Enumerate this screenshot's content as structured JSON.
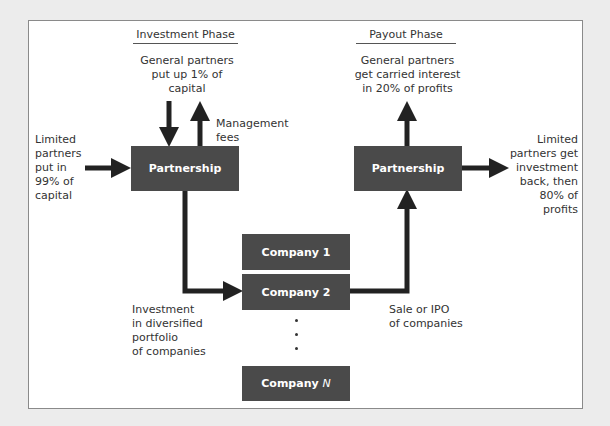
{
  "phases": {
    "investment": "Investment Phase",
    "payout": "Payout Phase"
  },
  "labels": {
    "gp_put_up": [
      "General partners",
      "put up 1% of",
      "capital"
    ],
    "management_fees": [
      "Management",
      "fees"
    ],
    "lp_put_in": [
      "Limited",
      "partners",
      "put in",
      "99% of",
      "capital"
    ],
    "gp_carried": [
      "General partners",
      "get carried interest",
      "in 20% of profits"
    ],
    "lp_get_back": [
      "Limited",
      "partners get",
      "investment",
      "back, then",
      "80% of",
      "profits"
    ],
    "investment_portfolio": [
      "Investment",
      "in diversified",
      "portfolio",
      "of companies"
    ],
    "sale_ipo": [
      "Sale or IPO",
      "of companies"
    ]
  },
  "boxes": {
    "partnership_left": "Partnership",
    "partnership_right": "Partnership",
    "company1": "Company 1",
    "company2": "Company 2",
    "companyN_prefix": "Company ",
    "companyN_var": "N"
  },
  "colors": {
    "box": "#4a4a4a",
    "arrow": "#222222",
    "frame_border": "#8a8a8a",
    "background": "#ececec"
  }
}
